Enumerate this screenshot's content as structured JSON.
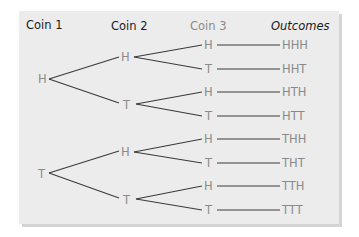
{
  "headers": {
    "coin1": "Coin 1",
    "coin2": "Coin 2",
    "coin3": "Coin 3",
    "outcomes": "Outcomes"
  },
  "coin1": [
    "H",
    "T"
  ],
  "coin2": [
    "H",
    "T",
    "H",
    "T"
  ],
  "coin3": [
    "H",
    "T",
    "H",
    "T",
    "H",
    "T",
    "H",
    "T"
  ],
  "outcomes": [
    "HHH",
    "HHT",
    "HTH",
    "HTT",
    "THH",
    "THT",
    "TTH",
    "TTT"
  ],
  "colors": {
    "panel": "#ececec",
    "header_text": "#1a1a1a",
    "coin3_header": "#8a8a8a",
    "node_text": "#8a8a8a",
    "branch_line": "#3a3a3a"
  }
}
